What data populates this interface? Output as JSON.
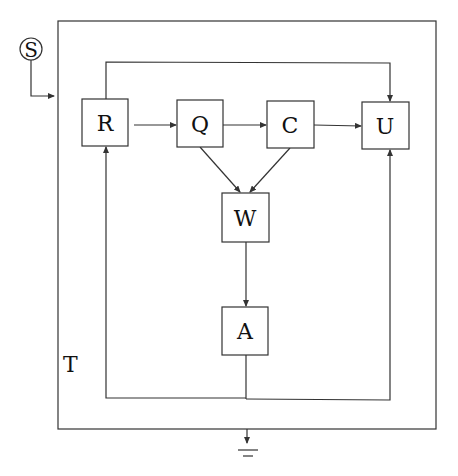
{
  "diagram": {
    "source_label": "S",
    "container_label": "T",
    "nodes": [
      {
        "id": "R",
        "label": "R"
      },
      {
        "id": "Q",
        "label": "Q"
      },
      {
        "id": "C",
        "label": "C"
      },
      {
        "id": "U",
        "label": "U"
      },
      {
        "id": "W",
        "label": "W"
      },
      {
        "id": "A",
        "label": "A"
      }
    ],
    "edges": [
      {
        "from": "S",
        "to": "T"
      },
      {
        "from": "R",
        "to": "Q"
      },
      {
        "from": "Q",
        "to": "C"
      },
      {
        "from": "C",
        "to": "U"
      },
      {
        "from": "R",
        "to": "U",
        "route": "top"
      },
      {
        "from": "Q",
        "to": "W"
      },
      {
        "from": "C",
        "to": "W"
      },
      {
        "from": "W",
        "to": "A"
      },
      {
        "from": "A",
        "to": "R",
        "route": "bottom-left"
      },
      {
        "from": "A",
        "to": "U",
        "route": "bottom-right"
      },
      {
        "from": "T",
        "to": "ground"
      }
    ],
    "colors": {
      "stroke": "#333333",
      "background": "#ffffff"
    }
  }
}
